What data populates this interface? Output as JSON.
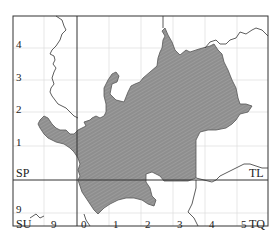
{
  "map": {
    "title": "",
    "region_fill": "#8f8f8f",
    "hatch_color": "#b0b0b0",
    "frame_color": "#333333",
    "grid_color": "#dcdcdc",
    "grid_squares": [
      {
        "id": "sp",
        "label": "SP"
      },
      {
        "id": "tl",
        "label": "TL"
      },
      {
        "id": "su",
        "label": "SU"
      },
      {
        "id": "tq",
        "label": "TQ"
      }
    ],
    "northing_labels": [
      "4",
      "3",
      "2",
      "1",
      "9"
    ],
    "easting_labels": [
      "9",
      "0",
      "1",
      "2",
      "3",
      "4",
      "5"
    ]
  }
}
